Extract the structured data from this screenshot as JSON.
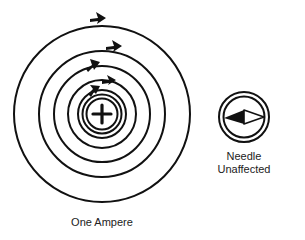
{
  "diagram": {
    "wire": {
      "symbol": "+",
      "label": "One Ampere",
      "center": [
        102,
        114
      ],
      "field_line_radii": [
        88,
        63,
        48,
        34,
        25,
        19
      ],
      "conductor_radius": 15,
      "field_direction": "clockwise"
    },
    "compass": {
      "center": [
        244,
        117
      ],
      "outer_radius": 25,
      "inner_radius": 21,
      "label_line1": "Needle",
      "label_line2": "Unaffected"
    },
    "colors": {
      "stroke": "#111111",
      "background": "#ffffff"
    }
  }
}
